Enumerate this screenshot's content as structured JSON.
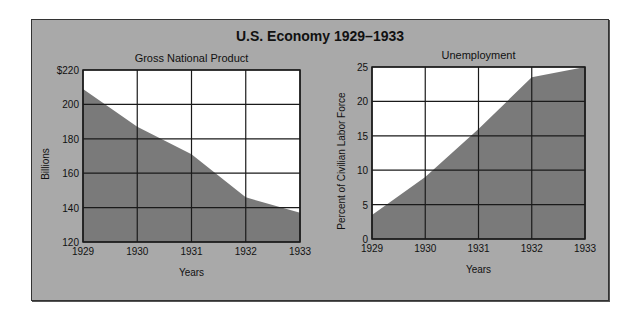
{
  "title": "U.S. Economy 1929–1933",
  "colors": {
    "panel": "#a9a9a9",
    "area": "#7a7a7a",
    "plot_bg": "#ffffff",
    "grid": "#1a1a1a"
  },
  "chart_data": [
    {
      "type": "area",
      "title": "Gross National Product",
      "xlabel": "Years",
      "ylabel": "Billions",
      "categories": [
        "1929",
        "1930",
        "1931",
        "1932",
        "1933"
      ],
      "values": [
        209,
        187,
        171,
        146,
        137
      ],
      "ylim": [
        120,
        220
      ],
      "yticks": [
        "120",
        "140",
        "160",
        "180",
        "200",
        "$220"
      ],
      "grid": true
    },
    {
      "type": "area",
      "title": "Unemployment",
      "xlabel": "Years",
      "ylabel": "Percent of Civilian Labor Force",
      "categories": [
        "1929",
        "1930",
        "1931",
        "1932",
        "1933"
      ],
      "values": [
        3.5,
        9,
        16,
        23.5,
        25
      ],
      "ylim": [
        0,
        25
      ],
      "yticks": [
        "0",
        "5",
        "10",
        "15",
        "20",
        "25"
      ],
      "grid": true
    }
  ]
}
